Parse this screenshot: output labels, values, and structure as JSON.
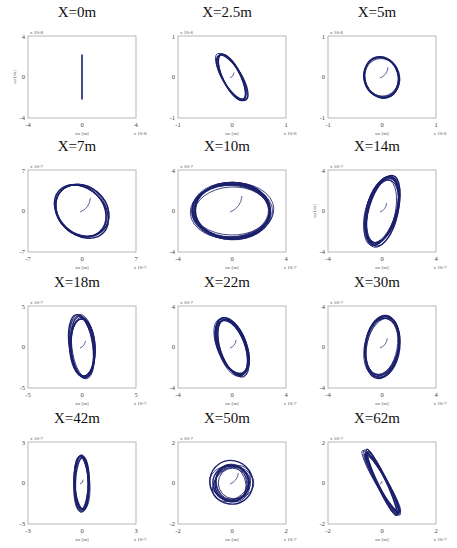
{
  "chart_data": [
    {
      "type": "line",
      "title": "X=0m",
      "xlabel": "ux [m]",
      "ylabel": "uz [m]",
      "xlim": [
        -4,
        4
      ],
      "ylim": [
        -4,
        4
      ],
      "x_ticks": [
        "-4",
        "0",
        "4"
      ],
      "y_ticks": [
        "4",
        "0",
        "-4"
      ],
      "exponent": "x 10^-8",
      "shape": "vertical line",
      "rx": 0.05,
      "ry": 2.2,
      "angle": 0,
      "loops": 1,
      "color": "#1a1f6b"
    },
    {
      "type": "line",
      "title": "X=2.5m",
      "xlabel": "ux [m]",
      "ylabel": "uz [m]",
      "xlim": [
        -1,
        1
      ],
      "ylim": [
        -1,
        1
      ],
      "x_ticks": [
        "-1",
        "0",
        "1"
      ],
      "y_ticks": [
        "1",
        "0",
        "-1"
      ],
      "exponent": "x 10^-6",
      "shape": "tilted ellipse",
      "rx": 0.17,
      "ry": 0.62,
      "angle": -28,
      "loops": 5,
      "color": "#1a1f6b"
    },
    {
      "type": "line",
      "title": "X=5m",
      "xlabel": "ux [m]",
      "ylabel": "uz [m]",
      "xlim": [
        -1,
        1
      ],
      "ylim": [
        -1,
        1
      ],
      "x_ticks": [
        "-1",
        "0",
        "1"
      ],
      "y_ticks": [
        "1",
        "0",
        "-1"
      ],
      "exponent": "x 10^-6",
      "shape": "ellipse",
      "rx": 0.33,
      "ry": 0.48,
      "angle": -15,
      "loops": 5,
      "color": "#1a1f6b"
    },
    {
      "type": "line",
      "title": "X=7m",
      "xlabel": "ux [m]",
      "ylabel": "uz [m]",
      "xlim": [
        -7,
        7
      ],
      "ylim": [
        -7,
        7
      ],
      "x_ticks": [
        "-7",
        "0",
        "7"
      ],
      "y_ticks": [
        "7",
        "0",
        "-7"
      ],
      "exponent": "x 10^-7",
      "shape": "tilted ellipse",
      "rx": 3.0,
      "ry": 5.0,
      "angle": -45,
      "loops": 6,
      "color": "#1a1f6b"
    },
    {
      "type": "line",
      "title": "X=10m",
      "xlabel": "ux [m]",
      "ylabel": "uz [m]",
      "xlim": [
        -4,
        4
      ],
      "ylim": [
        -4,
        4
      ],
      "x_ticks": [
        "-4",
        "0",
        "4"
      ],
      "y_ticks": [
        "4",
        "0",
        "-4"
      ],
      "exponent": "x 10^-7",
      "shape": "circle",
      "rx": 2.9,
      "ry": 2.6,
      "angle": 0,
      "loops": 12,
      "color": "#1a1f6b"
    },
    {
      "type": "line",
      "title": "X=14m",
      "xlabel": "ux [m]",
      "ylabel": "uz [m]",
      "xlim": [
        -4,
        4
      ],
      "ylim": [
        -4,
        4
      ],
      "x_ticks": [
        "-4",
        "0",
        "4"
      ],
      "y_ticks": [
        "4",
        "0",
        "-4"
      ],
      "exponent": "x 10^-7",
      "shape": "tilted ellipse",
      "rx": 1.1,
      "ry": 3.3,
      "angle": 15,
      "loops": 10,
      "color": "#1a1f6b"
    },
    {
      "type": "line",
      "title": "X=18m",
      "xlabel": "ux [m]",
      "ylabel": "uz [m]",
      "xlim": [
        -5,
        5
      ],
      "ylim": [
        -5,
        5
      ],
      "x_ticks": [
        "-5",
        "0",
        "5"
      ],
      "y_ticks": [
        "5",
        "0",
        "-5"
      ],
      "exponent": "x 10^-7",
      "shape": "vertical ellipse",
      "rx": 1.1,
      "ry": 3.7,
      "angle": -5,
      "loops": 10,
      "color": "#1a1f6b"
    },
    {
      "type": "line",
      "title": "X=22m",
      "xlabel": "ux [m]",
      "ylabel": "uz [m]",
      "xlim": [
        -4,
        4
      ],
      "ylim": [
        -4,
        4
      ],
      "x_ticks": [
        "-4",
        "0",
        "4"
      ],
      "y_ticks": [
        "4",
        "0",
        "-4"
      ],
      "exponent": "x 10^-7",
      "shape": "tilted ellipse",
      "rx": 1.0,
      "ry": 2.9,
      "angle": -20,
      "loops": 10,
      "color": "#1a1f6b"
    },
    {
      "type": "line",
      "title": "X=30m",
      "xlabel": "ux [m]",
      "ylabel": "uz [m]",
      "xlim": [
        -4,
        4
      ],
      "ylim": [
        -4,
        4
      ],
      "x_ticks": [
        "-4",
        "0",
        "4"
      ],
      "y_ticks": [
        "4",
        "0",
        "-4"
      ],
      "exponent": "x 10^-7",
      "shape": "tilted ellipse",
      "rx": 1.2,
      "ry": 2.9,
      "angle": 10,
      "loops": 8,
      "color": "#1a1f6b"
    },
    {
      "type": "line",
      "title": "X=42m",
      "xlabel": "ux [m]",
      "ylabel": "uz [m]",
      "xlim": [
        -3,
        3
      ],
      "ylim": [
        -3,
        3
      ],
      "x_ticks": [
        "-3",
        "0",
        "3"
      ],
      "y_ticks": [
        "3",
        "0",
        "-3"
      ],
      "exponent": "x 10^-7",
      "shape": "vertical ellipse",
      "rx": 0.4,
      "ry": 2.0,
      "angle": 0,
      "loops": 10,
      "color": "#1a1f6b"
    },
    {
      "type": "line",
      "title": "X=50m",
      "xlabel": "ux [m]",
      "ylabel": "uz [m]",
      "xlim": [
        -2,
        2
      ],
      "ylim": [
        -2,
        2
      ],
      "x_ticks": [
        "-2",
        "0",
        "2"
      ],
      "y_ticks": [
        "2",
        "0",
        "-2"
      ],
      "exponent": "x 10^-7",
      "shape": "irregular loops",
      "rx": 0.7,
      "ry": 0.9,
      "angle": 30,
      "loops": 10,
      "color": "#1a1f6b"
    },
    {
      "type": "line",
      "title": "X=62m",
      "xlabel": "ux [m]",
      "ylabel": "uz [m]",
      "xlim": [
        -2,
        2
      ],
      "ylim": [
        -2,
        2
      ],
      "x_ticks": [
        "-2",
        "0",
        "2"
      ],
      "y_ticks": [
        "2",
        "0",
        "-2"
      ],
      "exponent": "x 10^-7",
      "shape": "narrow tilted ellipse",
      "rx": 0.18,
      "ry": 1.7,
      "angle": -28,
      "loops": 10,
      "color": "#1a1f6b"
    }
  ],
  "layout": {
    "rows": 4,
    "cols": 3
  }
}
